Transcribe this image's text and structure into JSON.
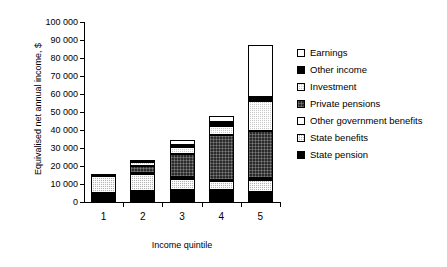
{
  "chart_data": {
    "type": "bar",
    "title": "",
    "subtitle": "",
    "stacked": true,
    "xlabel": "Income quintile",
    "ylabel": "Equivalised net annual income, $",
    "categories": [
      "1",
      "2",
      "3",
      "4",
      "5"
    ],
    "ylim": [
      0,
      100000
    ],
    "yticks": [
      0,
      10000,
      20000,
      30000,
      40000,
      50000,
      60000,
      70000,
      80000,
      90000,
      100000
    ],
    "ytick_labels": [
      "0",
      "10 000",
      "20 000",
      "30 000",
      "40 000",
      "50 000",
      "60 000",
      "70 000",
      "80 000",
      "90 000",
      "100 000"
    ],
    "grid": false,
    "legend_position": "right",
    "series": [
      {
        "name": "State pension",
        "key": "state-pension",
        "fill": "solid-black",
        "values": [
          5000,
          6000,
          6500,
          6500,
          5500
        ]
      },
      {
        "name": "State benefits",
        "key": "state-benefits",
        "fill": "light-dotted-grey",
        "values": [
          9500,
          9500,
          6500,
          5000,
          6500
        ]
      },
      {
        "name": "Other government benefits",
        "key": "other-gov-benefits",
        "fill": "white",
        "values": [
          500,
          500,
          1000,
          1000,
          1500
        ]
      },
      {
        "name": "Private pensions",
        "key": "private-pensions",
        "fill": "dark-hatch",
        "values": [
          0,
          4000,
          12500,
          24500,
          26000
        ]
      },
      {
        "name": "Investment",
        "key": "investment",
        "fill": "mid-dotted-grey",
        "values": [
          0,
          2000,
          4000,
          5500,
          16500
        ]
      },
      {
        "name": "Other income",
        "key": "other-income",
        "fill": "solid-black",
        "values": [
          0,
          0,
          1000,
          2000,
          2500
        ]
      },
      {
        "name": "Earnings",
        "key": "earnings",
        "fill": "white",
        "values": [
          0,
          1000,
          3000,
          3500,
          28500
        ]
      }
    ],
    "totals": [
      15000,
      23000,
      34500,
      48000,
      87000
    ]
  },
  "legend": {
    "items": [
      {
        "label": "Earnings"
      },
      {
        "label": "Other income"
      },
      {
        "label": "Investment"
      },
      {
        "label": "Private pensions"
      },
      {
        "label": "Other government benefits"
      },
      {
        "label": "State benefits"
      },
      {
        "label": "State pension"
      }
    ]
  }
}
